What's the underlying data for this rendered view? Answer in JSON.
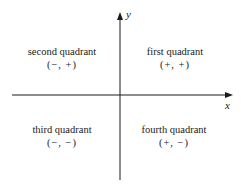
{
  "diagram": {
    "type": "coordinate-plane-quadrants",
    "axes": {
      "x_label": "x",
      "y_label": "y",
      "color": "#1a1a1a"
    },
    "quadrants": [
      {
        "name": "second quadrant",
        "signs": "(−, +)"
      },
      {
        "name": "first quadrant",
        "signs": "(+, +)"
      },
      {
        "name": "third quadrant",
        "signs": "(−, −)"
      },
      {
        "name": "fourth quadrant",
        "signs": "(+, −)"
      }
    ]
  }
}
